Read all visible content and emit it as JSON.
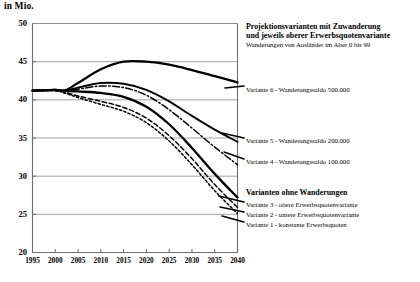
{
  "chart_data": {
    "type": "line",
    "title": "in Mio.",
    "xlabel": "",
    "ylabel": "in Mio.",
    "xlim": [
      1995,
      2040
    ],
    "ylim": [
      20,
      50
    ],
    "grid": true,
    "legend_position": "right",
    "xticks": [
      "1995",
      "2000",
      "2005",
      "2010",
      "2015",
      "2020",
      "2025",
      "2030",
      "2035",
      "2040"
    ],
    "yticks": [
      "20",
      "25",
      "30",
      "35",
      "40",
      "45",
      "50"
    ],
    "x": [
      1995,
      2000,
      2002,
      2005,
      2010,
      2015,
      2020,
      2025,
      2030,
      2035,
      2040
    ],
    "series": [
      {
        "name": "Variante 6 - Wanderungssaldo 500.000",
        "style": "solid-thick",
        "values": [
          41.2,
          41.3,
          41.2,
          42.2,
          44.0,
          45.0,
          45.0,
          44.6,
          43.9,
          43.1,
          42.3
        ]
      },
      {
        "name": "Variante 5 - Wanderungssaldo 200.000",
        "style": "solid",
        "values": [
          41.2,
          41.3,
          41.2,
          41.6,
          42.2,
          42.1,
          41.3,
          39.8,
          37.9,
          36.1,
          34.5
        ]
      },
      {
        "name": "Variante 4 - Wanderungssaldo 100.000",
        "style": "dash-dot",
        "values": [
          41.2,
          41.3,
          41.2,
          41.4,
          41.8,
          41.6,
          40.6,
          38.7,
          36.3,
          33.8,
          31.5
        ]
      },
      {
        "name": "Variante 3 - obere Erwerbsquotenvariante",
        "style": "solid-thick2",
        "values": [
          41.2,
          41.3,
          41.2,
          41.1,
          40.9,
          40.4,
          39.1,
          36.8,
          33.7,
          30.3,
          27.2
        ]
      },
      {
        "name": "Variante 2 - untere Erwerbsquotenvariante",
        "style": "dashed",
        "values": [
          41.2,
          41.2,
          41.0,
          40.5,
          39.8,
          39.0,
          37.6,
          35.3,
          32.3,
          28.9,
          25.9
        ]
      },
      {
        "name": "Variante 1 - konstante Erwerbsquoten",
        "style": "dotted",
        "values": [
          41.2,
          41.2,
          40.9,
          40.3,
          39.4,
          38.5,
          37.0,
          34.6,
          31.5,
          28.1,
          25.1
        ]
      }
    ]
  },
  "legend": {
    "group1": {
      "head_line1": "Projektionsvarianten mit Zuwanderung",
      "head_line2": "und jeweils oberer Erwerbsquotenvariante",
      "sub": "Wanderungen von Ausländer im Alter 0 bis 99",
      "items": [
        "Variante 6 - Wanderungssaldo 500.000",
        "Variante 5 - Wanderungssaldo 200.000",
        "Variante 4 - Wanderungssaldo 100.000"
      ]
    },
    "group2": {
      "head": "Varianten ohne Wanderungen",
      "items": [
        "Variante 3 - obere Erwerbsquotenvariante",
        "Variante 2 - untere Erwerbsquotenvariante",
        "Variante 1 - konstante Erwerbsquoten"
      ]
    }
  },
  "colors": {
    "line": "#000000",
    "grid": "#8a8a8a",
    "axis": "#6e6e6e",
    "background": "#ffffff"
  }
}
